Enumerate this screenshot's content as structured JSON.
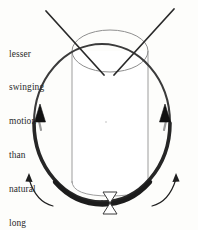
{
  "figure": {
    "name": "golf-swing-arc-diagram",
    "background_color": "#fdfdfb",
    "width": 198,
    "height": 230
  },
  "annotation": {
    "name": "swing-motion-note",
    "text_color": "#2b2b2b",
    "lines": [
      "lesser",
      "swinging",
      "motion",
      "than",
      "natural",
      "long",
      "club"
    ],
    "full_text": "lesser swinging motion than natural long club"
  },
  "shapes": {
    "cylinder": {
      "label": "cylinder-body",
      "stroke_color": "#9a9a9a",
      "fill_color": "#ffffff",
      "top_ellipse_cx": 110,
      "top_ellipse_cy": 51,
      "top_ellipse_rx": 38,
      "top_ellipse_ry": 21,
      "left_x": 72,
      "right_x": 148,
      "bottom_y": 196
    },
    "swing_arc": {
      "label": "swing-arc-oval",
      "stroke_color": "#2f2f2f",
      "cx": 102,
      "cy": 123,
      "rx": 68,
      "ry": 79,
      "stroke_width_min": 2.0,
      "stroke_width_max": 4.6,
      "direction": "counterclockwise-upward"
    },
    "arrowheads": [
      {
        "label": "arrowhead-left-up",
        "x": 40,
        "y": 112,
        "color": "#1a1a1a",
        "direction": "up"
      },
      {
        "label": "arrowhead-right-up",
        "x": 165,
        "y": 112,
        "color": "#1a1a1a",
        "direction": "up"
      }
    ],
    "club_lines": [
      {
        "label": "club-shaft-left",
        "x1": 46,
        "y1": 11,
        "x2": 104,
        "y2": 74,
        "stroke_color": "#2a2a2a",
        "stroke_width": 1.6
      },
      {
        "label": "club-shaft-right",
        "x1": 173,
        "y1": 9,
        "x2": 114,
        "y2": 74,
        "stroke_color": "#2a2a2a",
        "stroke_width": 1.6
      }
    ],
    "ball_marker": {
      "label": "ball-tee-hourglass",
      "cx": 110,
      "top_y": 192,
      "bottom_y": 214,
      "half_width": 7,
      "stroke_color": "#3a3a3a",
      "fill_color": "#ffffff"
    },
    "rotation_arrows": [
      {
        "label": "rotation-arrow-left",
        "side": "left",
        "stroke_color": "#1f1f1f",
        "stroke_width": 1.2
      },
      {
        "label": "rotation-arrow-right",
        "side": "right",
        "stroke_color": "#1f1f1f",
        "stroke_width": 1.2
      }
    ],
    "center_dot": {
      "label": "cylinder-center-dot",
      "cx": 106,
      "cy": 122,
      "r": 0.8,
      "color": "#b5b5b5"
    }
  }
}
